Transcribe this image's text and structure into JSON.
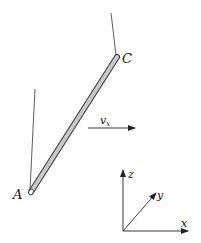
{
  "diagram": {
    "points": {
      "A": {
        "label": "A"
      },
      "C": {
        "label": "C"
      }
    },
    "velocity": {
      "label": "v",
      "subscript": "x"
    },
    "axes": {
      "x": "x",
      "y": "y",
      "z": "z"
    },
    "colors": {
      "rod_fill": "#c8c8c8",
      "stroke": "#222222"
    }
  }
}
